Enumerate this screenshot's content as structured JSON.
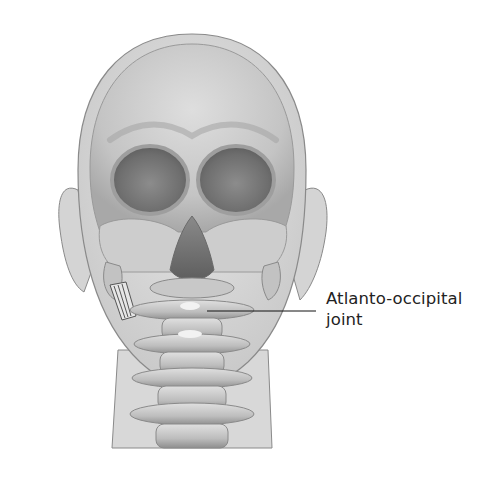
{
  "figure": {
    "colors": {
      "background": "#ffffff",
      "skin": "#dcdcdc",
      "skin_outline": "#8a8a8a",
      "bone_light": "#d6d6d6",
      "bone_mid": "#b4b4b4",
      "bone_dark": "#7a7a7a",
      "orbit_shadow": "#6a6a6a",
      "leader_line": "#111111",
      "label_text": "#222222"
    }
  },
  "callouts": [
    {
      "id": "atlanto-occipital-joint",
      "lines": [
        "Atlanto-occipital",
        "joint"
      ],
      "leader": {
        "x1": 207,
        "y1": 311,
        "x2": 316,
        "y2": 311
      }
    }
  ]
}
